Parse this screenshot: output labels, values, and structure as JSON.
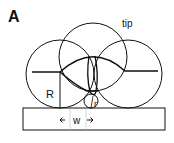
{
  "panel_label": "A",
  "labels": {
    "tip": "tip",
    "R": "R",
    "r": "r",
    "w": "w"
  },
  "colors": {
    "line": "#111111",
    "background": "#ffffff"
  }
}
